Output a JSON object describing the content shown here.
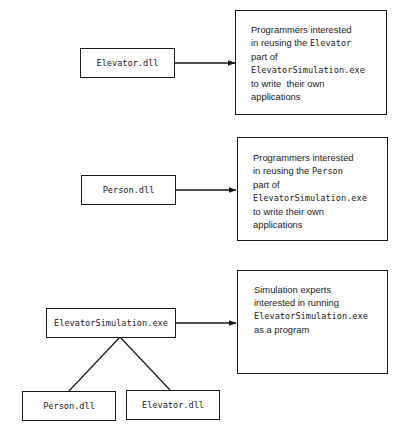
{
  "diagram": {
    "groups": [
      {
        "source": {
          "label": "Elevator.dll"
        },
        "audience": {
          "lines": [
            {
              "parts": [
                {
                  "text": "Programmers interested",
                  "mono": false
                }
              ]
            },
            {
              "parts": [
                {
                  "text": "in reusing the ",
                  "mono": false
                },
                {
                  "text": "Elevator",
                  "mono": true
                }
              ]
            },
            {
              "parts": [
                {
                  "text": "part of",
                  "mono": false
                }
              ]
            },
            {
              "parts": [
                {
                  "text": "ElevatorSimulation.exe",
                  "mono": true
                }
              ]
            },
            {
              "parts": [
                {
                  "text": "to write  their own",
                  "mono": false
                }
              ]
            },
            {
              "parts": [
                {
                  "text": "applications",
                  "mono": false
                }
              ]
            }
          ]
        }
      },
      {
        "source": {
          "label": "Person.dll"
        },
        "audience": {
          "lines": [
            {
              "parts": [
                {
                  "text": "Programmers interested",
                  "mono": false
                }
              ]
            },
            {
              "parts": [
                {
                  "text": "in reusing the ",
                  "mono": false
                },
                {
                  "text": "Person",
                  "mono": true
                }
              ]
            },
            {
              "parts": [
                {
                  "text": "part of",
                  "mono": false
                }
              ]
            },
            {
              "parts": [
                {
                  "text": "ElevatorSimulation.exe",
                  "mono": true
                }
              ]
            },
            {
              "parts": [
                {
                  "text": "to write their own",
                  "mono": false
                }
              ]
            },
            {
              "parts": [
                {
                  "text": "applications",
                  "mono": false
                }
              ]
            }
          ]
        }
      },
      {
        "source": {
          "label": "ElevatorSimulation.exe"
        },
        "dependencies": [
          {
            "label": "Person.dll"
          },
          {
            "label": "Elevator.dll"
          }
        ],
        "audience": {
          "lines": [
            {
              "parts": [
                {
                  "text": "Simulation experts",
                  "mono": false
                }
              ]
            },
            {
              "parts": [
                {
                  "text": "interested in running",
                  "mono": false
                }
              ]
            },
            {
              "parts": [
                {
                  "text": "ElevatorSimulation.exe",
                  "mono": true
                }
              ]
            },
            {
              "parts": [
                {
                  "text": "as a program",
                  "mono": false
                }
              ]
            }
          ]
        }
      }
    ]
  },
  "colors": {
    "stroke": "#1a1a1a",
    "text": "#222222",
    "background": "#ffffff"
  }
}
